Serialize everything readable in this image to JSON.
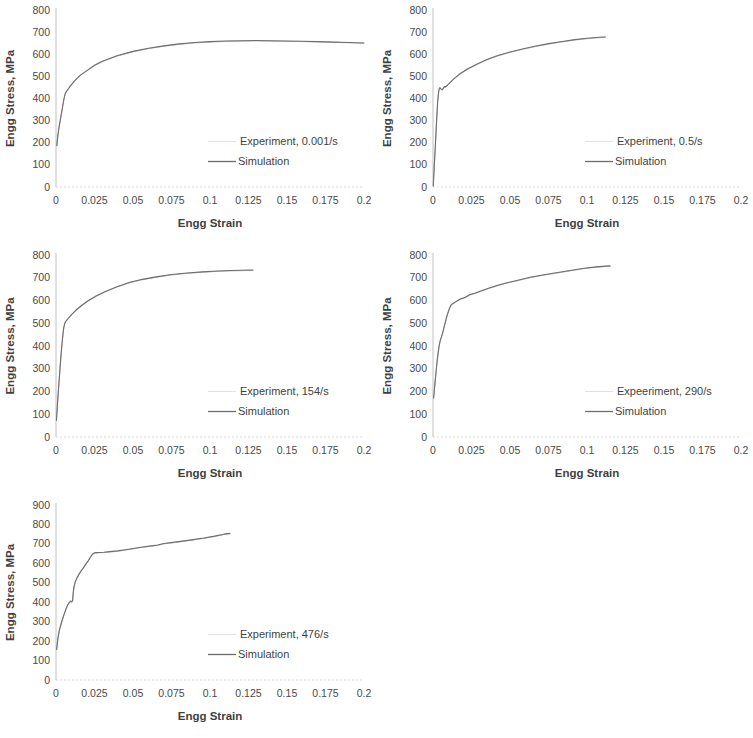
{
  "figure": {
    "background": "#ffffff",
    "line_color": "#6e6e6e",
    "grid_color": "#d9d9d9",
    "panel_count": 5
  },
  "chart_data": [
    {
      "id": "panel-1",
      "type": "line",
      "title": "",
      "xlabel": "Engg Strain",
      "ylabel": "Engg Stress, MPa",
      "xlim": [
        0,
        0.2
      ],
      "ylim": [
        0,
        800
      ],
      "xticks": [
        "0",
        "0.025",
        "0.05",
        "0.075",
        "0.1",
        "0.125",
        "0.15",
        "0.175",
        "0.2"
      ],
      "xtick_values": [
        0,
        0.025,
        0.05,
        0.075,
        0.1,
        0.125,
        0.15,
        0.175,
        0.2
      ],
      "yticks": [
        "0",
        "100",
        "200",
        "300",
        "400",
        "500",
        "600",
        "700",
        "800"
      ],
      "ytick_values": [
        0,
        100,
        200,
        300,
        400,
        500,
        600,
        700,
        800
      ],
      "grid": false,
      "legend_position": "inside-lower-right",
      "legend": [
        "Experiment, 0.001/s",
        "Simulation"
      ],
      "series": [
        {
          "name": "Experiment, 0.001/s",
          "x": [
            0.0005,
            0.0012,
            0.002,
            0.003,
            0.004,
            0.005,
            0.0055,
            0.006,
            0.007,
            0.009,
            0.012,
            0.016,
            0.02,
            0.025,
            0.03,
            0.04,
            0.05,
            0.06,
            0.07,
            0.08,
            0.09,
            0.1,
            0.11,
            0.12,
            0.13,
            0.14,
            0.15,
            0.16,
            0.17,
            0.18,
            0.19,
            0.2
          ],
          "y": [
            185,
            230,
            270,
            310,
            350,
            390,
            408,
            420,
            432,
            452,
            478,
            505,
            524,
            548,
            566,
            592,
            611,
            625,
            636,
            645,
            651,
            655,
            658,
            659,
            660,
            659,
            658,
            657,
            656,
            654,
            652,
            650
          ]
        },
        {
          "name": "Simulation",
          "x": [
            0.0005,
            0.0012,
            0.002,
            0.003,
            0.004,
            0.005,
            0.0055,
            0.006,
            0.007,
            0.009,
            0.012,
            0.016,
            0.02,
            0.025,
            0.03,
            0.04,
            0.05,
            0.06,
            0.07,
            0.08,
            0.09,
            0.1,
            0.11,
            0.12,
            0.13,
            0.14,
            0.15,
            0.16,
            0.17,
            0.18,
            0.19,
            0.2
          ],
          "y": [
            187,
            232,
            272,
            312,
            352,
            392,
            410,
            422,
            434,
            454,
            480,
            507,
            526,
            550,
            568,
            594,
            613,
            627,
            638,
            647,
            653,
            657,
            660,
            661,
            662,
            661,
            660,
            659,
            657,
            655,
            653,
            651
          ]
        }
      ]
    },
    {
      "id": "panel-2",
      "type": "line",
      "title": "",
      "xlabel": "Engg Strain",
      "ylabel": "Engg Stress, MPa",
      "xlim": [
        0,
        0.2
      ],
      "ylim": [
        0,
        800
      ],
      "xticks": [
        "0",
        "0.025",
        "0.05",
        "0.075",
        "0.1",
        "0.125",
        "0.15",
        "0.175",
        "0.2"
      ],
      "xtick_values": [
        0,
        0.025,
        0.05,
        0.075,
        0.1,
        0.125,
        0.15,
        0.175,
        0.2
      ],
      "yticks": [
        "0",
        "100",
        "200",
        "300",
        "400",
        "500",
        "600",
        "700",
        "800"
      ],
      "ytick_values": [
        0,
        100,
        200,
        300,
        400,
        500,
        600,
        700,
        800
      ],
      "grid": false,
      "legend_position": "inside-lower-right",
      "legend": [
        "Experiment, 0.5/s",
        "Simulation"
      ],
      "series": [
        {
          "name": "Experiment, 0.5/s",
          "x": [
            0.0002,
            0.0008,
            0.0015,
            0.0022,
            0.003,
            0.0035,
            0.004,
            0.0045,
            0.005,
            0.0058,
            0.0065,
            0.007,
            0.0075,
            0.008,
            0.009,
            0.011,
            0.014,
            0.018,
            0.022,
            0.028,
            0.035,
            0.042,
            0.05,
            0.058,
            0.066,
            0.075,
            0.084,
            0.092,
            0.1,
            0.106,
            0.11,
            0.112
          ],
          "y": [
            5,
            90,
            180,
            280,
            380,
            420,
            442,
            447,
            443,
            437,
            441,
            448,
            452,
            450,
            456,
            470,
            490,
            512,
            530,
            552,
            574,
            592,
            608,
            622,
            634,
            646,
            656,
            664,
            670,
            674,
            676,
            676
          ]
        },
        {
          "name": "Simulation",
          "x": [
            0.0002,
            0.0008,
            0.0015,
            0.0022,
            0.003,
            0.0035,
            0.004,
            0.0045,
            0.005,
            0.0058,
            0.0065,
            0.007,
            0.0075,
            0.008,
            0.009,
            0.011,
            0.014,
            0.018,
            0.022,
            0.028,
            0.035,
            0.042,
            0.05,
            0.058,
            0.066,
            0.075,
            0.084,
            0.092,
            0.1,
            0.106,
            0.11,
            0.112
          ],
          "y": [
            6,
            92,
            183,
            283,
            383,
            422,
            444,
            449,
            445,
            440,
            444,
            450,
            454,
            452,
            458,
            472,
            492,
            514,
            532,
            554,
            576,
            594,
            610,
            624,
            636,
            648,
            658,
            666,
            672,
            676,
            678,
            678
          ]
        }
      ]
    },
    {
      "id": "panel-3",
      "type": "line",
      "title": "",
      "xlabel": "Engg Strain",
      "ylabel": "Engg Stress, MPa",
      "xlim": [
        0,
        0.2
      ],
      "ylim": [
        0,
        800
      ],
      "xticks": [
        "0",
        "0.025",
        "0.05",
        "0.075",
        "0.1",
        "0.125",
        "0.15",
        "0.175",
        "0.2"
      ],
      "xtick_values": [
        0,
        0.025,
        0.05,
        0.075,
        0.1,
        0.125,
        0.15,
        0.175,
        0.2
      ],
      "yticks": [
        "0",
        "100",
        "200",
        "300",
        "400",
        "500",
        "600",
        "700",
        "800"
      ],
      "ytick_values": [
        0,
        100,
        200,
        300,
        400,
        500,
        600,
        700,
        800
      ],
      "grid": false,
      "legend_position": "inside-lower-right",
      "legend": [
        "Experiment, 154/s",
        "Simulation"
      ],
      "series": [
        {
          "name": "Experiment, 154/s",
          "x": [
            0.0003,
            0.001,
            0.0018,
            0.0026,
            0.0034,
            0.0042,
            0.005,
            0.0056,
            0.006,
            0.0065,
            0.007,
            0.008,
            0.01,
            0.013,
            0.017,
            0.021,
            0.026,
            0.032,
            0.04,
            0.048,
            0.056,
            0.065,
            0.075,
            0.085,
            0.095,
            0.105,
            0.113,
            0.12,
            0.125,
            0.128
          ],
          "y": [
            72,
            150,
            225,
            300,
            370,
            430,
            478,
            495,
            503,
            508,
            512,
            520,
            536,
            556,
            578,
            598,
            618,
            638,
            660,
            678,
            691,
            702,
            712,
            719,
            724,
            728,
            730,
            731,
            732,
            732
          ]
        },
        {
          "name": "Simulation",
          "x": [
            0.0003,
            0.001,
            0.0018,
            0.0026,
            0.0034,
            0.0042,
            0.005,
            0.0056,
            0.006,
            0.0065,
            0.007,
            0.008,
            0.01,
            0.013,
            0.017,
            0.021,
            0.026,
            0.032,
            0.04,
            0.048,
            0.056,
            0.065,
            0.075,
            0.085,
            0.095,
            0.105,
            0.113,
            0.12,
            0.125,
            0.128
          ],
          "y": [
            74,
            152,
            227,
            302,
            372,
            432,
            480,
            497,
            505,
            510,
            514,
            522,
            538,
            558,
            580,
            600,
            620,
            640,
            662,
            680,
            693,
            704,
            714,
            721,
            726,
            730,
            732,
            733,
            734,
            734
          ]
        }
      ]
    },
    {
      "id": "panel-4",
      "type": "line",
      "title": "",
      "xlabel": "Engg Strain",
      "ylabel": "Engg Stress, MPa",
      "xlim": [
        0,
        0.2
      ],
      "ylim": [
        0,
        800
      ],
      "xticks": [
        "0",
        "0.025",
        "0.05",
        "0.075",
        "0.1",
        "0.125",
        "0.15",
        "0.175",
        "0.2"
      ],
      "xtick_values": [
        0,
        0.025,
        0.05,
        0.075,
        0.1,
        0.125,
        0.15,
        0.175,
        0.2
      ],
      "yticks": [
        "0",
        "100",
        "200",
        "300",
        "400",
        "500",
        "600",
        "700",
        "800"
      ],
      "ytick_values": [
        0,
        100,
        200,
        300,
        400,
        500,
        600,
        700,
        800
      ],
      "grid": false,
      "legend_position": "inside-lower-right",
      "legend": [
        "Expeeriment, 290/s",
        "Simulation"
      ],
      "series": [
        {
          "name": "Expeeriment, 290/s",
          "x": [
            0.0004,
            0.001,
            0.0016,
            0.0022,
            0.0028,
            0.0034,
            0.004,
            0.0048,
            0.0056,
            0.0065,
            0.0075,
            0.0085,
            0.0095,
            0.0105,
            0.0115,
            0.0122,
            0.013,
            0.0145,
            0.016,
            0.018,
            0.021,
            0.024,
            0.027,
            0.031,
            0.036,
            0.042,
            0.048,
            0.055,
            0.063,
            0.071,
            0.08,
            0.089,
            0.098,
            0.106,
            0.112,
            0.115
          ],
          "y": [
            170,
            215,
            258,
            300,
            338,
            372,
            400,
            425,
            440,
            462,
            490,
            516,
            540,
            560,
            576,
            582,
            585,
            592,
            598,
            606,
            612,
            624,
            630,
            640,
            652,
            665,
            676,
            687,
            700,
            710,
            720,
            730,
            740,
            746,
            749,
            750
          ]
        },
        {
          "name": "Simulation",
          "x": [
            0.0004,
            0.001,
            0.0016,
            0.0022,
            0.0028,
            0.0034,
            0.004,
            0.0048,
            0.0056,
            0.0065,
            0.0075,
            0.0085,
            0.0095,
            0.0105,
            0.0115,
            0.0122,
            0.013,
            0.0145,
            0.016,
            0.018,
            0.021,
            0.024,
            0.027,
            0.031,
            0.036,
            0.042,
            0.048,
            0.055,
            0.063,
            0.071,
            0.08,
            0.089,
            0.098,
            0.106,
            0.112,
            0.115
          ],
          "y": [
            172,
            217,
            260,
            302,
            340,
            374,
            402,
            427,
            442,
            464,
            492,
            518,
            542,
            562,
            578,
            584,
            587,
            594,
            600,
            608,
            614,
            626,
            632,
            642,
            654,
            667,
            678,
            689,
            702,
            712,
            722,
            732,
            742,
            748,
            751,
            752
          ]
        }
      ]
    },
    {
      "id": "panel-5",
      "type": "line",
      "title": "",
      "xlabel": "Engg Strain",
      "ylabel": "Engg Stress, MPa",
      "xlim": [
        0,
        0.2
      ],
      "ylim": [
        0,
        900
      ],
      "xticks": [
        "0",
        "0.025",
        "0.05",
        "0.075",
        "0.1",
        "0.125",
        "0.15",
        "0.175",
        "0.2"
      ],
      "xtick_values": [
        0,
        0.025,
        0.05,
        0.075,
        0.1,
        0.125,
        0.15,
        0.175,
        0.2
      ],
      "yticks": [
        "0",
        "100",
        "200",
        "300",
        "400",
        "500",
        "600",
        "700",
        "800",
        "900"
      ],
      "ytick_values": [
        0,
        100,
        200,
        300,
        400,
        500,
        600,
        700,
        800,
        900
      ],
      "grid": false,
      "legend_position": "inside-lower-right",
      "legend": [
        "Experiment, 476/s",
        "Simulation"
      ],
      "series": [
        {
          "name": "Experiment, 476/s",
          "x": [
            0.0004,
            0.0012,
            0.002,
            0.0028,
            0.0036,
            0.0045,
            0.0055,
            0.0065,
            0.0075,
            0.0085,
            0.0095,
            0.0102,
            0.0108,
            0.0112,
            0.0118,
            0.0126,
            0.0135,
            0.0148,
            0.016,
            0.0175,
            0.019,
            0.021,
            0.0225,
            0.0238,
            0.0248,
            0.026,
            0.028,
            0.031,
            0.035,
            0.04,
            0.045,
            0.05,
            0.056,
            0.062,
            0.066,
            0.07,
            0.076,
            0.082,
            0.089,
            0.096,
            0.103,
            0.109,
            0.113
          ],
          "y": [
            155,
            210,
            248,
            272,
            295,
            318,
            342,
            364,
            382,
            396,
            404,
            400,
            406,
            450,
            482,
            505,
            522,
            540,
            556,
            572,
            590,
            612,
            632,
            646,
            652,
            653,
            654,
            655,
            658,
            662,
            668,
            674,
            682,
            688,
            692,
            700,
            706,
            712,
            720,
            728,
            738,
            748,
            752
          ]
        },
        {
          "name": "Simulation",
          "x": [
            0.0004,
            0.0012,
            0.002,
            0.0028,
            0.0036,
            0.0045,
            0.0055,
            0.0065,
            0.0075,
            0.0085,
            0.0095,
            0.0102,
            0.0108,
            0.0112,
            0.0118,
            0.0126,
            0.0135,
            0.0148,
            0.016,
            0.0175,
            0.019,
            0.021,
            0.0225,
            0.0238,
            0.0248,
            0.026,
            0.028,
            0.031,
            0.035,
            0.04,
            0.045,
            0.05,
            0.056,
            0.062,
            0.066,
            0.07,
            0.076,
            0.082,
            0.089,
            0.096,
            0.103,
            0.109,
            0.113
          ],
          "y": [
            157,
            212,
            250,
            274,
            297,
            320,
            344,
            366,
            384,
            398,
            406,
            402,
            408,
            452,
            484,
            507,
            524,
            542,
            558,
            574,
            592,
            614,
            634,
            648,
            654,
            655,
            656,
            657,
            660,
            664,
            670,
            676,
            684,
            690,
            694,
            702,
            708,
            714,
            722,
            730,
            740,
            750,
            754
          ]
        }
      ]
    }
  ]
}
